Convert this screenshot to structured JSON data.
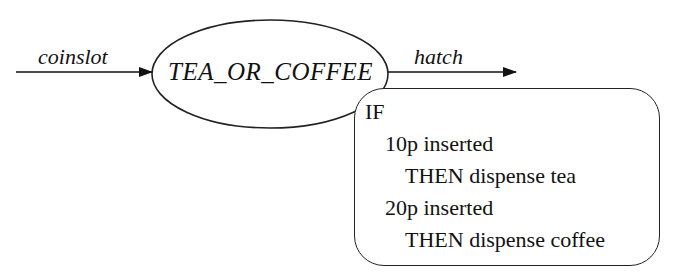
{
  "diagram": {
    "input_arrow": {
      "label": "coinslot"
    },
    "process": {
      "label": "TEA_OR_COFFEE"
    },
    "output_arrow": {
      "label": "hatch"
    },
    "annotation": {
      "lines": [
        {
          "text": "IF",
          "indent": 0
        },
        {
          "text": "10p inserted",
          "indent": 1
        },
        {
          "text": "THEN dispense tea",
          "indent": 2
        },
        {
          "text": "20p inserted",
          "indent": 1
        },
        {
          "text": "THEN dispense coffee",
          "indent": 2
        }
      ]
    },
    "colors": {
      "stroke": "#222222",
      "text": "#111111",
      "background": "#ffffff"
    }
  }
}
